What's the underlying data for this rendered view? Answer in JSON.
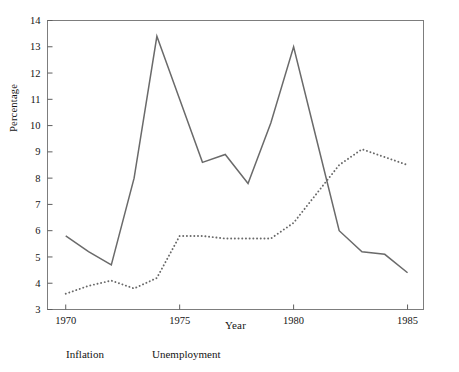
{
  "chart_data": {
    "type": "line",
    "title": "",
    "xlabel": "Year",
    "ylabel": "Percentage",
    "x": [
      1970,
      1971,
      1972,
      1973,
      1974,
      1975,
      1976,
      1977,
      1978,
      1979,
      1980,
      1981,
      1982,
      1983,
      1984,
      1985
    ],
    "xlim": [
      1969.2,
      1985.7
    ],
    "ylim": [
      3,
      14
    ],
    "xticks": [
      1970,
      1975,
      1980,
      1985
    ],
    "xtick_labels": [
      "1970",
      "1975",
      "1980",
      "1985"
    ],
    "yticks": [
      3,
      4,
      5,
      6,
      7,
      8,
      9,
      10,
      11,
      12,
      13,
      14
    ],
    "ytick_labels": [
      "3",
      "4",
      "5",
      "6",
      "7",
      "8",
      "9",
      "10",
      "11",
      "12",
      "13",
      "14"
    ],
    "grid": false,
    "legend_position": "below-axes",
    "series": [
      {
        "name": "Inflation",
        "style": "solid",
        "color": "#6a6a6a",
        "values": [
          5.8,
          5.2,
          4.7,
          8.0,
          13.4,
          11.0,
          8.6,
          8.9,
          7.8,
          10.1,
          13.0,
          9.5,
          6.0,
          5.2,
          5.1,
          4.4
        ]
      },
      {
        "name": "Unemployment",
        "style": "dotted",
        "color": "#6a6a6a",
        "values": [
          3.6,
          3.9,
          4.1,
          3.8,
          4.2,
          5.8,
          5.8,
          5.7,
          5.7,
          5.7,
          6.3,
          7.4,
          8.5,
          9.1,
          8.8,
          8.5
        ]
      }
    ]
  },
  "legend": {
    "inflation": "Inflation",
    "unemployment": "Unemployment"
  },
  "axes": {
    "x_title": "Year",
    "y_title": "Percentage"
  },
  "colors": {
    "line": "#6a6a6a",
    "frame": "#7d7d7d",
    "text": "#141414",
    "background": "#ffffff"
  }
}
